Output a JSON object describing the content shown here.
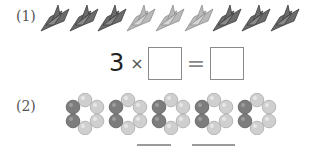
{
  "problems": [
    {
      "label": "(1)",
      "items": {
        "type": "paper-crane",
        "count": 9,
        "groups": [
          {
            "shade": "dark",
            "count": 3
          },
          {
            "shade": "light",
            "count": 3
          },
          {
            "shade": "dark",
            "count": 3
          }
        ]
      },
      "equation": {
        "factor": "3",
        "times_symbol": "×",
        "blank_1": "",
        "equals_symbol": "=",
        "blank_2": ""
      }
    },
    {
      "label": "(2)",
      "items": {
        "type": "bead-ring",
        "count": 5,
        "beads_per_ring": 6,
        "dark_per_ring": 2,
        "light_per_ring": 4
      },
      "answer_blanks": [
        "",
        ""
      ]
    }
  ],
  "colors": {
    "crane_dark": "#6b6b6b",
    "crane_light": "#b9b9b9",
    "bead_dark": "#7d7d7d",
    "bead_light": "#cfcfcf",
    "box_border": "#8a8a8a"
  }
}
